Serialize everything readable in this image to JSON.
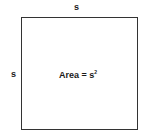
{
  "diagram": {
    "shape": "square",
    "top_label": "s",
    "left_label": "s",
    "area_prefix": "Area = s",
    "area_exponent": "2"
  }
}
